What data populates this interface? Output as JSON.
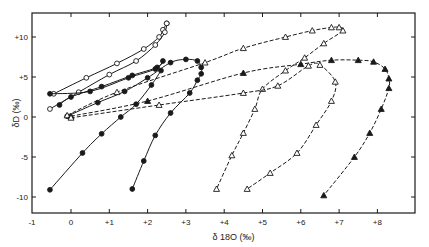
{
  "chart_data": {
    "type": "line",
    "title": "",
    "xlabel": "δ 18O (‰)",
    "ylabel": "δD (‰)",
    "xlim": [
      -1,
      9
    ],
    "ylim": [
      -11.5,
      13
    ],
    "x_ticks": [
      -1,
      0,
      1,
      2,
      3,
      4,
      5,
      6,
      7,
      8
    ],
    "x_tick_labels": [
      "-1",
      "0",
      "+1",
      "+2",
      "+3",
      "+4",
      "+5",
      "+6",
      "+7",
      "+8"
    ],
    "y_ticks": [
      10,
      5,
      0,
      -5,
      -10
    ],
    "y_tick_labels": [
      "+10",
      "+5",
      "0",
      "-5",
      "-10"
    ],
    "grid": false,
    "legend": null,
    "series": [
      {
        "name": "open-circles-upper",
        "marker": "open-circle",
        "line": "solid",
        "points": [
          [
            -0.45,
            2.9
          ],
          [
            0.4,
            4.9
          ],
          [
            1.2,
            6.7
          ],
          [
            1.9,
            8.5
          ],
          [
            2.3,
            10.0
          ],
          [
            2.4,
            10.9
          ],
          [
            2.5,
            11.7
          ]
        ]
      },
      {
        "name": "open-circles-lower",
        "marker": "open-circle",
        "line": "solid",
        "points": [
          [
            -0.55,
            1.0
          ],
          [
            0.2,
            3.1
          ],
          [
            1.0,
            5.3
          ],
          [
            1.7,
            7.0
          ],
          [
            2.2,
            9.0
          ],
          [
            2.45,
            10.6
          ],
          [
            2.5,
            11.7
          ]
        ]
      },
      {
        "name": "filled-circles-loop",
        "marker": "filled-circle",
        "line": "solid",
        "points": [
          [
            -0.55,
            2.9
          ],
          [
            0.5,
            3.2
          ],
          [
            1.5,
            4.9
          ],
          [
            2.2,
            6.0
          ],
          [
            2.4,
            7.0
          ],
          [
            2.25,
            6.2
          ],
          [
            1.6,
            5.2
          ],
          [
            0.8,
            3.8
          ],
          [
            0.0,
            2.5
          ],
          [
            -0.3,
            1.5
          ]
        ]
      },
      {
        "name": "filled-circles-main",
        "marker": "filled-circle",
        "line": "solid",
        "points": [
          [
            -0.1,
            0.1
          ],
          [
            0.7,
            1.8
          ],
          [
            1.4,
            3.2
          ],
          [
            2.0,
            4.9
          ],
          [
            2.6,
            6.8
          ],
          [
            3.0,
            7.2
          ],
          [
            3.3,
            7.0
          ],
          [
            3.4,
            6.2
          ],
          [
            3.4,
            5.4
          ],
          [
            3.3,
            4.6
          ],
          [
            3.1,
            3.0
          ],
          [
            2.6,
            0.5
          ],
          [
            2.2,
            -2.3
          ],
          [
            1.9,
            -5.5
          ],
          [
            1.6,
            -9.0
          ]
        ]
      },
      {
        "name": "filled-circles-left-line",
        "marker": "filled-circle",
        "line": "solid",
        "points": [
          [
            -0.55,
            -9.1
          ],
          [
            0.3,
            -4.5
          ],
          [
            0.8,
            -2.1
          ],
          [
            1.3,
            0.0
          ],
          [
            1.7,
            1.6
          ],
          [
            2.1,
            4.0
          ],
          [
            2.35,
            5.8
          ]
        ]
      },
      {
        "name": "open-triangles",
        "marker": "open-triangle",
        "line": "dashed",
        "points": [
          [
            -0.1,
            0.2
          ],
          [
            1.2,
            3.1
          ],
          [
            3.5,
            6.8
          ],
          [
            4.5,
            8.6
          ],
          [
            5.6,
            10.0
          ],
          [
            6.3,
            10.8
          ],
          [
            6.8,
            11.2
          ],
          [
            7.0,
            11.2
          ],
          [
            7.1,
            10.8
          ],
          [
            6.6,
            9.2
          ],
          [
            6.1,
            7.4
          ],
          [
            5.6,
            5.8
          ],
          [
            5.0,
            3.5
          ],
          [
            4.8,
            1.0
          ],
          [
            4.5,
            -2.0
          ],
          [
            4.2,
            -4.8
          ],
          [
            3.8,
            -9.0
          ]
        ]
      },
      {
        "name": "filled-triangles",
        "marker": "filled-triangle",
        "line": "dashed",
        "points": [
          [
            0.0,
            0.1
          ],
          [
            2.0,
            2.0
          ],
          [
            4.5,
            5.5
          ],
          [
            6.0,
            6.6
          ],
          [
            6.8,
            7.1
          ],
          [
            7.5,
            7.1
          ],
          [
            7.9,
            6.9
          ],
          [
            8.2,
            6.0
          ],
          [
            8.3,
            4.8
          ],
          [
            8.3,
            3.6
          ],
          [
            8.1,
            1.0
          ],
          [
            7.8,
            -2.0
          ],
          [
            7.4,
            -5.0
          ],
          [
            6.6,
            -9.8
          ]
        ]
      },
      {
        "name": "open-triangles-lower-dashed",
        "marker": "open-triangle",
        "line": "dashed",
        "points": [
          [
            0.0,
            -0.1
          ],
          [
            2.3,
            1.5
          ],
          [
            4.5,
            3.0
          ],
          [
            5.4,
            3.9
          ],
          [
            6.2,
            6.4
          ],
          [
            6.5,
            6.5
          ],
          [
            6.9,
            4.4
          ],
          [
            6.8,
            2.0
          ],
          [
            6.4,
            -1.0
          ],
          [
            5.9,
            -4.5
          ],
          [
            5.2,
            -7.0
          ],
          [
            4.6,
            -9.0
          ]
        ]
      }
    ]
  },
  "frame": {
    "left": 32,
    "top": 13,
    "right": 415,
    "bottom": 213
  },
  "mapping": {
    "x0_px": 71,
    "px_per_x": 38.3,
    "y0_px": 117,
    "px_per_y": 8
  },
  "colors": {
    "ink": "#1a1a1a",
    "background": "#ffffff"
  }
}
